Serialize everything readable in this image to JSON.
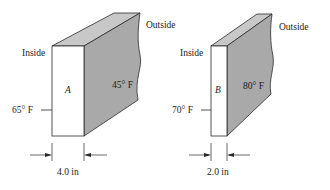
{
  "walls": [
    {
      "id": "A",
      "label": "A",
      "inside_label": "Inside",
      "outside_label": "Outside",
      "inside_temp": "65° F",
      "outside_temp": "45° F",
      "thickness": "4.0 in"
    },
    {
      "id": "B",
      "label": "B",
      "inside_label": "Inside",
      "outside_label": "Outside",
      "inside_temp": "70° F",
      "outside_temp": "80° F",
      "thickness": "2.0 in"
    }
  ],
  "colors": {
    "front_face": "#ffffff",
    "top_face": "#c8c8c8",
    "side_face": "#a9a9a9",
    "stroke": "#2a2a2a"
  }
}
